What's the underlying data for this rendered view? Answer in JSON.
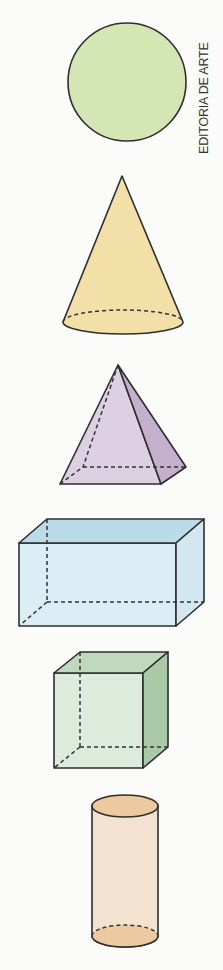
{
  "credit": "EDITORIA DE ARTE",
  "shapes": [
    {
      "id": "sphere",
      "name": "Esfera",
      "color": "#d3e6b3"
    },
    {
      "id": "cone",
      "name": "Cone",
      "color": "#f3dfa8"
    },
    {
      "id": "pyramid",
      "name": "Pirâmide",
      "color": "#ddd0e3",
      "side_color": "#c4b0cc"
    },
    {
      "id": "prism",
      "name": "Paralelepípedo",
      "color": "#dceef5",
      "top_color": "#bcdbe8",
      "side_color": "#d2e7f0"
    },
    {
      "id": "cube",
      "name": "Cubo",
      "color": "#dcebdc",
      "top_color": "#bfd8be",
      "side_color": "#a9c9a7"
    },
    {
      "id": "cylinder",
      "name": "Cilindro",
      "color": "#f2e2cf",
      "cap_color": "#edc9a0"
    }
  ]
}
